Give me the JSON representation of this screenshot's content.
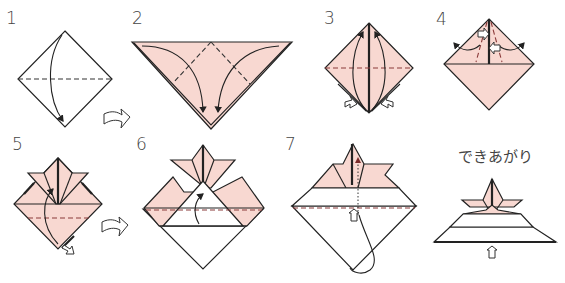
{
  "colors": {
    "paper_color": "#f8d8d1",
    "line_color": "#222222",
    "background": "#ffffff"
  },
  "steps": [
    {
      "label": "1",
      "description": "Fold square diagonally in half (valley fold, top corner down)"
    },
    {
      "label": "2",
      "description": "Fold left and right corners down to bottom point"
    },
    {
      "label": "3",
      "description": "Fold bottom flaps up to top point"
    },
    {
      "label": "4",
      "description": "Fold flaps outward at angles"
    },
    {
      "label": "5",
      "description": "Fold front bottom layer up"
    },
    {
      "label": "6",
      "description": "Fold up again along dashed line"
    },
    {
      "label": "7",
      "description": "Fold remaining bottom layer up behind; open hat"
    },
    {
      "label": "できあがり",
      "description": "Finished"
    }
  ],
  "icons": {
    "next_step_arrow": "hollow-curved-arrow-icon",
    "push_arrow": "hollow-push-arrow-icon"
  }
}
